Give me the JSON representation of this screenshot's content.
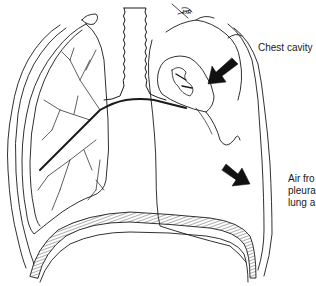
{
  "figure": {
    "colors": {
      "line": "#1a1a1a",
      "background": "#ffffff",
      "arrow": "#111111"
    },
    "signature": "DR"
  },
  "labels": {
    "chest_cavity": "Chest cavity",
    "air_line1": "Air fro",
    "air_line2": "pleura",
    "air_line3": "lung a"
  },
  "icons": {
    "arrow_upper": "arrow-down-left",
    "arrow_lower": "arrow-down-right"
  }
}
